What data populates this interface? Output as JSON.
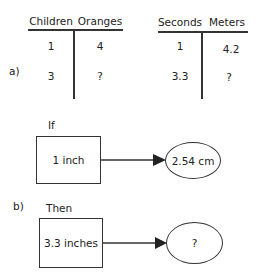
{
  "part_a": {
    "label": "a)",
    "table_left": {
      "headers": [
        "Children",
        "Oranges"
      ],
      "rows": [
        [
          "1",
          "4"
        ],
        [
          "3",
          "?"
        ]
      ]
    },
    "table_right": {
      "headers": [
        "Seconds",
        "Meters"
      ],
      "rows": [
        [
          "1",
          "4.2"
        ],
        [
          "3.3",
          "?"
        ]
      ]
    }
  },
  "part_b": {
    "label": "b)",
    "if_block": {
      "label": "If",
      "box_text": "1 inch",
      "result_text": "2.54 cm"
    },
    "then_block": {
      "label": "Then",
      "box_text": "3.3 inches",
      "result_text": "?"
    }
  }
}
